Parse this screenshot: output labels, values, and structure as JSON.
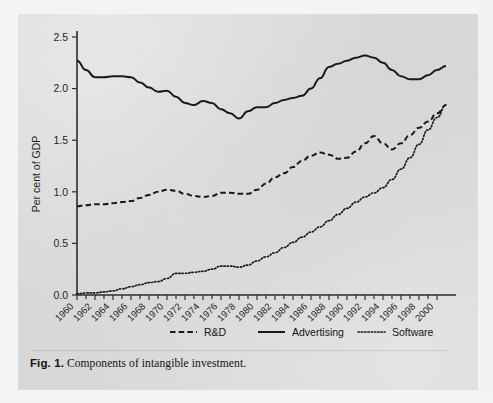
{
  "figure": {
    "caption_label": "Fig. 1.",
    "caption_text": "Components of intangible investment."
  },
  "chart_data": {
    "type": "line",
    "title": "",
    "xlabel": "",
    "ylabel": "Per cent of GDP",
    "xlim": [
      1960,
      2001
    ],
    "ylim": [
      0.0,
      2.5
    ],
    "grid": false,
    "legend_position": "bottom",
    "ytick_labels": [
      "0.0",
      "0.5",
      "1.0",
      "1.5",
      "2.0",
      "2.5"
    ],
    "ytick_values": [
      0.0,
      0.5,
      1.0,
      1.5,
      2.0,
      2.5
    ],
    "xtick_labels": [
      "1960",
      "1962",
      "1964",
      "1966",
      "1968",
      "1970",
      "1972",
      "1974",
      "1976",
      "1978",
      "1980",
      "1982",
      "1984",
      "1986",
      "1988",
      "1990",
      "1992",
      "1994",
      "1996",
      "1998",
      "2000"
    ],
    "xtick_values": [
      1960,
      1962,
      1964,
      1966,
      1968,
      1970,
      1972,
      1974,
      1976,
      1978,
      1980,
      1982,
      1984,
      1986,
      1988,
      1990,
      1992,
      1994,
      1996,
      1998,
      2000
    ],
    "x": [
      1960,
      1961,
      1962,
      1963,
      1964,
      1965,
      1966,
      1967,
      1968,
      1969,
      1970,
      1971,
      1972,
      1973,
      1974,
      1975,
      1976,
      1977,
      1978,
      1979,
      1980,
      1981,
      1982,
      1983,
      1984,
      1985,
      1986,
      1987,
      1988,
      1989,
      1990,
      1991,
      1992,
      1993,
      1994,
      1995,
      1996,
      1997,
      1998,
      1999,
      2000,
      2001
    ],
    "series": [
      {
        "name": "R&D",
        "style": "dashed",
        "color": "#1a1a1a",
        "values": [
          0.86,
          0.87,
          0.88,
          0.88,
          0.89,
          0.9,
          0.91,
          0.94,
          0.97,
          1.0,
          1.02,
          1.01,
          0.98,
          0.96,
          0.95,
          0.96,
          0.99,
          0.99,
          0.98,
          0.98,
          1.02,
          1.08,
          1.14,
          1.18,
          1.24,
          1.3,
          1.35,
          1.38,
          1.36,
          1.32,
          1.33,
          1.39,
          1.47,
          1.54,
          1.47,
          1.41,
          1.47,
          1.55,
          1.62,
          1.68,
          1.76,
          1.84
        ]
      },
      {
        "name": "Advertising",
        "style": "solid",
        "color": "#1a1a1a",
        "values": [
          2.27,
          2.18,
          2.11,
          2.11,
          2.12,
          2.12,
          2.11,
          2.06,
          2.01,
          1.97,
          1.98,
          1.92,
          1.86,
          1.84,
          1.88,
          1.86,
          1.8,
          1.76,
          1.71,
          1.78,
          1.82,
          1.82,
          1.86,
          1.89,
          1.91,
          1.93,
          2.0,
          2.1,
          2.21,
          2.24,
          2.27,
          2.3,
          2.32,
          2.3,
          2.25,
          2.18,
          2.12,
          2.09,
          2.09,
          2.13,
          2.18,
          2.22
        ]
      },
      {
        "name": "Software",
        "style": "dotted",
        "color": "#1a1a1a",
        "values": [
          0.01,
          0.02,
          0.02,
          0.03,
          0.04,
          0.06,
          0.08,
          0.1,
          0.12,
          0.13,
          0.16,
          0.21,
          0.21,
          0.22,
          0.23,
          0.25,
          0.28,
          0.28,
          0.27,
          0.29,
          0.33,
          0.37,
          0.41,
          0.46,
          0.51,
          0.56,
          0.61,
          0.66,
          0.72,
          0.78,
          0.84,
          0.9,
          0.95,
          0.99,
          1.04,
          1.12,
          1.22,
          1.33,
          1.46,
          1.6,
          1.72,
          1.84
        ]
      }
    ],
    "advertising_tail": [
      2.24,
      2.28,
      2.32,
      2.36
    ],
    "legend": [
      {
        "label": "R&D",
        "style": "dashed"
      },
      {
        "label": "Advertising",
        "style": "solid"
      },
      {
        "label": "Software",
        "style": "dotted"
      }
    ]
  }
}
